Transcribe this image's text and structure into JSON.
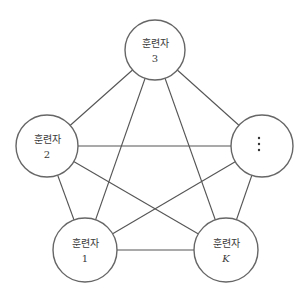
{
  "diagram": {
    "type": "complete-graph",
    "colors": {
      "edge": "#555555",
      "node_stroke": "#666666",
      "node_fill": "#ffffff",
      "text": "#3a3a3a"
    },
    "nodes": [
      {
        "id": "n3",
        "label": "훈련자",
        "sub": "3",
        "cx": 155,
        "cy": 50,
        "r": 30
      },
      {
        "id": "n2",
        "label": "훈련자",
        "sub": "2",
        "cx": 47,
        "cy": 146,
        "r": 31
      },
      {
        "id": "nd",
        "label": "",
        "sub": "⋮",
        "cx": 262,
        "cy": 146,
        "r": 31
      },
      {
        "id": "n1",
        "label": "훈련자",
        "sub": "1",
        "cx": 85,
        "cy": 250,
        "r": 32
      },
      {
        "id": "nK",
        "label": "훈련자",
        "sub": "K",
        "cx": 226,
        "cy": 250,
        "r": 32
      }
    ],
    "edges": [
      [
        "n3",
        "n2"
      ],
      [
        "n3",
        "nd"
      ],
      [
        "n3",
        "n1"
      ],
      [
        "n3",
        "nK"
      ],
      [
        "n2",
        "nd"
      ],
      [
        "n2",
        "n1"
      ],
      [
        "n2",
        "nK"
      ],
      [
        "nd",
        "n1"
      ],
      [
        "nd",
        "nK"
      ],
      [
        "n1",
        "nK"
      ]
    ]
  }
}
